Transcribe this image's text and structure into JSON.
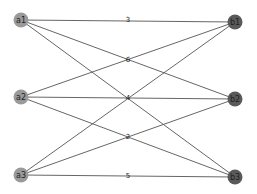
{
  "diagram": {
    "type": "bipartite-graph",
    "nodes": [
      {
        "id": "a1",
        "label": "a1",
        "group": "left",
        "x": 21,
        "y": 20
      },
      {
        "id": "a2",
        "label": "a2",
        "group": "left",
        "x": 21,
        "y": 97
      },
      {
        "id": "a3",
        "label": "a3",
        "group": "left",
        "x": 21,
        "y": 175
      },
      {
        "id": "b1",
        "label": "b1",
        "group": "right",
        "x": 235,
        "y": 22
      },
      {
        "id": "b2",
        "label": "b2",
        "group": "right",
        "x": 235,
        "y": 99
      },
      {
        "id": "b3",
        "label": "b3",
        "group": "right",
        "x": 235,
        "y": 177
      }
    ],
    "edges": [
      {
        "from": "a1",
        "to": "b1"
      },
      {
        "from": "a1",
        "to": "b2"
      },
      {
        "from": "a1",
        "to": "b3"
      },
      {
        "from": "a2",
        "to": "b1"
      },
      {
        "from": "a2",
        "to": "b2"
      },
      {
        "from": "a2",
        "to": "b3"
      },
      {
        "from": "a3",
        "to": "b1"
      },
      {
        "from": "a3",
        "to": "b2"
      },
      {
        "from": "a3",
        "to": "b3"
      }
    ],
    "edge_labels": [
      {
        "text": "3",
        "x": 128,
        "y": 20
      },
      {
        "text": "6",
        "x": 128,
        "y": 60
      },
      {
        "text": "4",
        "x": 128,
        "y": 98
      },
      {
        "text": "2",
        "x": 128,
        "y": 137
      },
      {
        "text": "5",
        "x": 128,
        "y": 176
      }
    ],
    "colors": {
      "left_node": "#9a9a9a",
      "right_node": "#5a5a5a",
      "edge": "#555555",
      "background": "#ffffff"
    }
  }
}
